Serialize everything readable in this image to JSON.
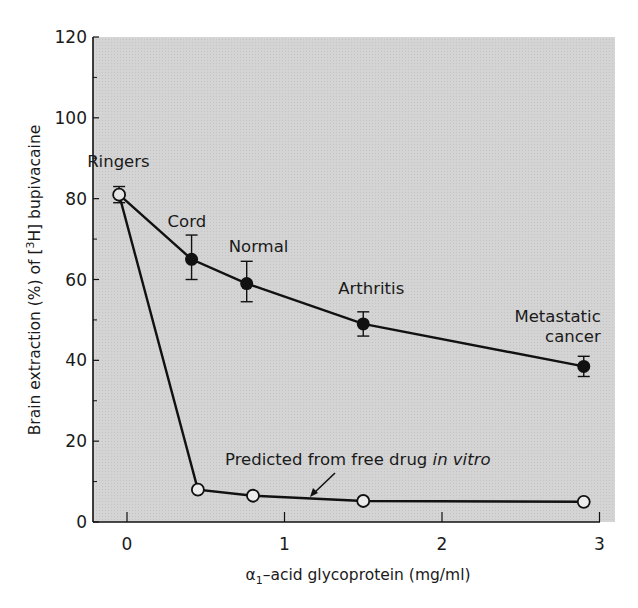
{
  "chart_data": {
    "type": "line",
    "title": "",
    "xlabel": "α1–acid glycoprotein (mg/ml)",
    "ylabel": "Brain extraction (%) of [3H] bupivacaine",
    "xlim": [
      -0.22,
      3.1
    ],
    "ylim": [
      0,
      120
    ],
    "xticks": [
      0,
      1,
      2,
      3
    ],
    "yticks": [
      0,
      20,
      40,
      60,
      80,
      100,
      120
    ],
    "grid": false,
    "legend": null,
    "series": [
      {
        "name": "Measured",
        "marker": "filled-circle",
        "points": [
          {
            "label": "Ringers",
            "x": -0.05,
            "y": 81,
            "err_low": 79,
            "err_high": 83
          },
          {
            "label": "Cord",
            "x": 0.41,
            "y": 65,
            "err_low": 60,
            "err_high": 71
          },
          {
            "label": "Normal",
            "x": 0.76,
            "y": 59,
            "err_low": 54.5,
            "err_high": 64.5
          },
          {
            "label": "Arthritis",
            "x": 1.5,
            "y": 49,
            "err_low": 46,
            "err_high": 52
          },
          {
            "label": "Metastatic cancer",
            "x": 2.9,
            "y": 38.5,
            "err_low": 36,
            "err_high": 41
          }
        ]
      },
      {
        "name": "Predicted from free drug in vitro",
        "marker": "open-circle",
        "points": [
          {
            "x": -0.05,
            "y": 81
          },
          {
            "x": 0.45,
            "y": 8
          },
          {
            "x": 0.8,
            "y": 6.5
          },
          {
            "x": 1.5,
            "y": 5.2
          },
          {
            "x": 2.9,
            "y": 5
          }
        ]
      }
    ],
    "annotations": [
      {
        "text": "Predicted from free drug",
        "italic_suffix": "in vitro",
        "arrow_to": {
          "x": 1.17,
          "y": 5.8
        }
      }
    ]
  },
  "labels": {
    "ylabel_pre": "Brain extraction (%) of [",
    "ylabel_sup": "3",
    "ylabel_post": "H] bupivacaine",
    "xlabel_alpha": "α",
    "xlabel_sub": "1",
    "xlabel_post": "–acid glycoprotein (mg/ml)",
    "annotation_main": "Predicted from free drug ",
    "annotation_italic": "in vitro",
    "metastatic_line1": "Metastatic",
    "metastatic_line2": "cancer"
  },
  "colors": {
    "plot_bg": "#d2d2d2",
    "ink": "#111111"
  }
}
